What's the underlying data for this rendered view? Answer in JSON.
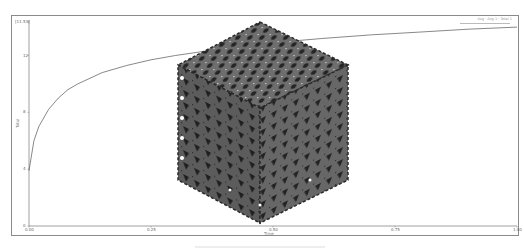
{
  "chart_data": {
    "type": "line",
    "title": "",
    "xlabel": "Time",
    "ylabel": "Total",
    "x_ticks": [
      "0.00",
      "0.25",
      "0.50",
      "0.75",
      "1.00"
    ],
    "y_ticks": [
      "[11.53]",
      "12",
      "8",
      "4",
      "0"
    ],
    "xlim": [
      0,
      1
    ],
    "ylim": [
      0,
      14.5
    ],
    "grid": false,
    "legend_position": "top-right",
    "legend_entries": [
      "Avg · Avg 1 · Total 1"
    ],
    "series": [
      {
        "name": "Total",
        "color": "#555555",
        "x": [
          0.0,
          0.01,
          0.02,
          0.04,
          0.06,
          0.08,
          0.1,
          0.15,
          0.2,
          0.25,
          0.3,
          0.4,
          0.5,
          0.6,
          0.7,
          0.8,
          0.9,
          1.0
        ],
        "y": [
          3.9,
          6.0,
          7.0,
          8.2,
          9.0,
          9.6,
          10.0,
          10.8,
          11.3,
          11.7,
          12.0,
          12.5,
          12.9,
          13.2,
          13.45,
          13.65,
          13.85,
          14.0
        ]
      }
    ],
    "overlay": "3D lattice cube render (gyroid-like cellular structure)"
  },
  "colors": {
    "frame": "#8a8a8a",
    "line": "#555555",
    "cube_dark": "#2b2b2b",
    "cube_mid": "#5a5a5a",
    "cube_light": "#7d7d7d"
  }
}
